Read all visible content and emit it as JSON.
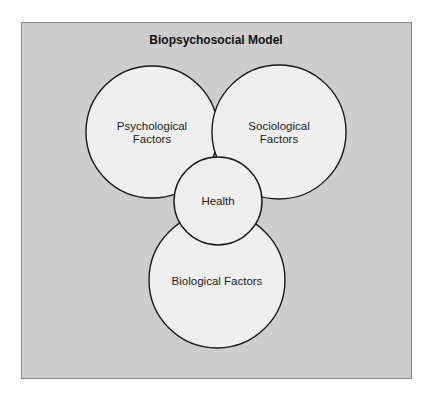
{
  "diagram": {
    "title": "Biopsychosocial Model",
    "nodes": [
      {
        "id": "psychological",
        "label_line1": "Psychological",
        "label_line2": "Factors"
      },
      {
        "id": "sociological",
        "label_line1": "Sociological",
        "label_line2": "Factors"
      },
      {
        "id": "health",
        "label": "Health"
      },
      {
        "id": "biological",
        "label": "Biological Factors"
      }
    ],
    "colors": {
      "panel": "#cdcdcd",
      "circle_fill": "#efefef",
      "stroke": "#1a1a1a"
    }
  }
}
